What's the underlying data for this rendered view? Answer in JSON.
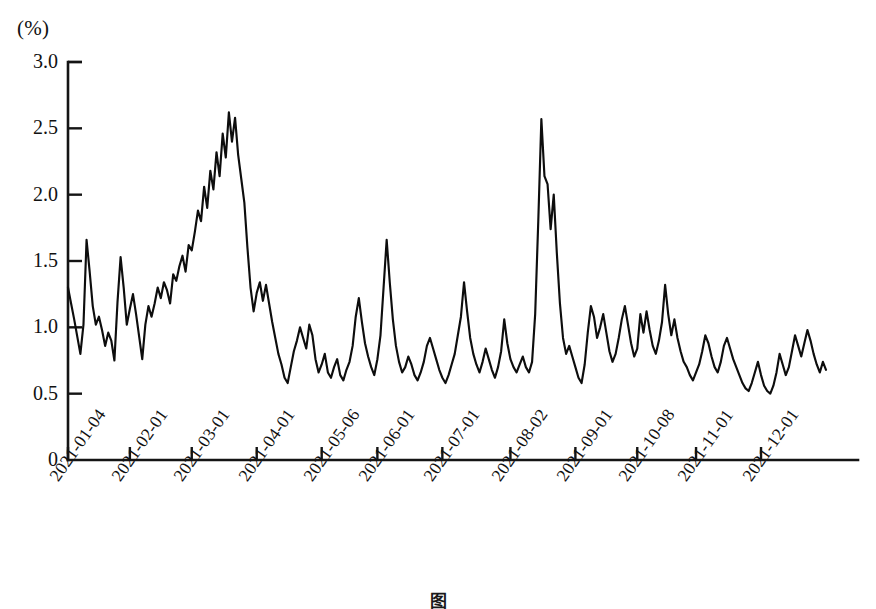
{
  "figure": {
    "unit_label": "(%)",
    "caption": "图"
  },
  "chart_data": {
    "type": "line",
    "title": "",
    "subtitle": "",
    "xlabel": "",
    "ylabel": "(%)",
    "unit": "%",
    "grid": false,
    "legend": null,
    "ylim": [
      0,
      3.0
    ],
    "ytick_labels": [
      "0",
      "0.5",
      "1.0",
      "1.5",
      "2.0",
      "2.5",
      "3.0"
    ],
    "ytick_values": [
      0,
      0.5,
      1.0,
      1.5,
      2.0,
      2.5,
      3.0
    ],
    "xtick_labels": [
      "2021-01-04",
      "2021-02-01",
      "2021-03-01",
      "2021-04-01",
      "2021-05-06",
      "2021-06-01",
      "2021-07-01",
      "2021-08-02",
      "2021-09-01",
      "2021-10-08",
      "2021-11-01",
      "2021-12-01"
    ],
    "xtick_index": [
      0,
      20,
      40,
      61,
      82,
      100,
      121,
      143,
      164,
      184,
      203,
      224
    ],
    "series": [
      {
        "name": "rate",
        "values": [
          1.3,
          1.18,
          1.06,
          0.93,
          0.8,
          1.02,
          1.66,
          1.42,
          1.16,
          1.02,
          1.08,
          0.98,
          0.86,
          0.96,
          0.9,
          0.75,
          1.19,
          1.53,
          1.3,
          1.02,
          1.14,
          1.25,
          1.1,
          0.93,
          0.76,
          1.02,
          1.16,
          1.08,
          1.18,
          1.3,
          1.22,
          1.34,
          1.28,
          1.18,
          1.4,
          1.35,
          1.46,
          1.54,
          1.42,
          1.62,
          1.58,
          1.72,
          1.88,
          1.8,
          2.06,
          1.9,
          2.18,
          2.04,
          2.32,
          2.14,
          2.46,
          2.28,
          2.62,
          2.4,
          2.58,
          2.3,
          2.12,
          1.94,
          1.6,
          1.3,
          1.12,
          1.26,
          1.34,
          1.2,
          1.32,
          1.18,
          1.04,
          0.92,
          0.8,
          0.72,
          0.62,
          0.58,
          0.7,
          0.82,
          0.9,
          1.0,
          0.92,
          0.84,
          1.02,
          0.94,
          0.76,
          0.66,
          0.72,
          0.8,
          0.66,
          0.62,
          0.7,
          0.76,
          0.64,
          0.6,
          0.68,
          0.74,
          0.86,
          1.08,
          1.22,
          1.04,
          0.88,
          0.78,
          0.7,
          0.64,
          0.76,
          0.94,
          1.3,
          1.66,
          1.34,
          1.06,
          0.86,
          0.74,
          0.66,
          0.7,
          0.78,
          0.72,
          0.64,
          0.6,
          0.66,
          0.74,
          0.86,
          0.92,
          0.84,
          0.76,
          0.68,
          0.62,
          0.58,
          0.64,
          0.72,
          0.8,
          0.94,
          1.08,
          1.34,
          1.12,
          0.92,
          0.8,
          0.72,
          0.66,
          0.74,
          0.84,
          0.76,
          0.68,
          0.62,
          0.7,
          0.82,
          1.06,
          0.88,
          0.76,
          0.7,
          0.66,
          0.72,
          0.78,
          0.7,
          0.66,
          0.74,
          1.1,
          1.8,
          2.57,
          2.14,
          2.08,
          1.74,
          2.0,
          1.56,
          1.18,
          0.92,
          0.8,
          0.86,
          0.78,
          0.7,
          0.62,
          0.58,
          0.72,
          0.96,
          1.16,
          1.08,
          0.92,
          1.0,
          1.1,
          0.96,
          0.82,
          0.74,
          0.8,
          0.92,
          1.06,
          1.16,
          1.02,
          0.88,
          0.78,
          0.84,
          1.1,
          0.96,
          1.12,
          0.98,
          0.86,
          0.8,
          0.9,
          1.04,
          1.32,
          1.1,
          0.94,
          1.06,
          0.92,
          0.82,
          0.74,
          0.7,
          0.64,
          0.6,
          0.66,
          0.72,
          0.82,
          0.94,
          0.88,
          0.78,
          0.7,
          0.66,
          0.74,
          0.86,
          0.92,
          0.84,
          0.76,
          0.7,
          0.64,
          0.58,
          0.54,
          0.52,
          0.58,
          0.66,
          0.74,
          0.64,
          0.56,
          0.52,
          0.5,
          0.56,
          0.66,
          0.8,
          0.72,
          0.64,
          0.7,
          0.82,
          0.94,
          0.86,
          0.78,
          0.88,
          0.98,
          0.9,
          0.8,
          0.72,
          0.66,
          0.74,
          0.68
        ]
      }
    ],
    "annotations": {
      "max_value": 2.62,
      "max_label": "2021-03",
      "secondary_peak_value": 2.57,
      "secondary_peak_label": "2021-08",
      "min_value": 0.5,
      "start_value": 1.3,
      "end_value": 0.68
    }
  }
}
